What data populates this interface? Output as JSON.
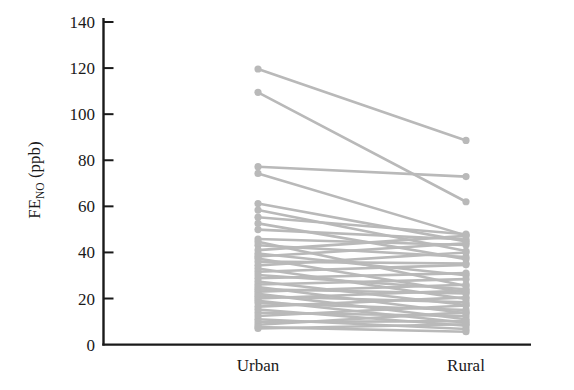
{
  "chart_data": {
    "type": "line",
    "subtype": "paired-slope-chart",
    "title": "",
    "subtitle": "",
    "xlabel": "",
    "ylabel": "FE_NO (ppb)",
    "ylabel_parts": {
      "base": "FE",
      "subscript": "NO",
      "unit": "(ppb)"
    },
    "categories": [
      "Urban",
      "Rural"
    ],
    "x_tick_labels": [
      "Urban",
      "Rural"
    ],
    "y_tick_labels": [
      "0",
      "20",
      "40",
      "60",
      "80",
      "100",
      "120",
      "140"
    ],
    "y_ticks": [
      0,
      20,
      40,
      60,
      80,
      100,
      120,
      140
    ],
    "ylim": [
      0,
      142
    ],
    "grid": false,
    "legend": null,
    "legend_position": "none",
    "marker": "circle",
    "series_color": "#b9b9b9",
    "axis_color": "#1a1a1a",
    "background_color": "#ffffff",
    "n_subjects": 41,
    "series": [
      {
        "name": "subject-01",
        "values": [
          119.6,
          88.6
        ]
      },
      {
        "name": "subject-02",
        "values": [
          109.5,
          62.0
        ]
      },
      {
        "name": "subject-03",
        "values": [
          77.2,
          72.9
        ]
      },
      {
        "name": "subject-04",
        "values": [
          74.3,
          47.4
        ]
      },
      {
        "name": "subject-05",
        "values": [
          61.2,
          44.8
        ]
      },
      {
        "name": "subject-06",
        "values": [
          58.4,
          40.6
        ]
      },
      {
        "name": "subject-07",
        "values": [
          55.3,
          47.9
        ]
      },
      {
        "name": "subject-08",
        "values": [
          52.6,
          37.1
        ]
      },
      {
        "name": "subject-09",
        "values": [
          49.9,
          45.6
        ]
      },
      {
        "name": "subject-10",
        "values": [
          45.8,
          43.2
        ]
      },
      {
        "name": "subject-11",
        "values": [
          44.6,
          25.4
        ]
      },
      {
        "name": "subject-12",
        "values": [
          43.1,
          38.0
        ]
      },
      {
        "name": "subject-13",
        "values": [
          41.0,
          47.2
        ]
      },
      {
        "name": "subject-14",
        "values": [
          39.5,
          30.1
        ]
      },
      {
        "name": "subject-15",
        "values": [
          38.2,
          44.0
        ]
      },
      {
        "name": "subject-16",
        "values": [
          37.4,
          22.6
        ]
      },
      {
        "name": "subject-17",
        "values": [
          36.0,
          35.2
        ]
      },
      {
        "name": "subject-18",
        "values": [
          34.4,
          40.0
        ]
      },
      {
        "name": "subject-19",
        "values": [
          33.0,
          19.8
        ]
      },
      {
        "name": "subject-20",
        "values": [
          31.6,
          34.6
        ]
      },
      {
        "name": "subject-21",
        "values": [
          30.2,
          24.0
        ]
      },
      {
        "name": "subject-22",
        "values": [
          28.8,
          31.0
        ]
      },
      {
        "name": "subject-23",
        "values": [
          27.4,
          17.2
        ]
      },
      {
        "name": "subject-24",
        "values": [
          26.1,
          28.4
        ]
      },
      {
        "name": "subject-25",
        "values": [
          25.0,
          13.6
        ]
      },
      {
        "name": "subject-26",
        "values": [
          24.0,
          22.2
        ]
      },
      {
        "name": "subject-27",
        "values": [
          23.0,
          26.0
        ]
      },
      {
        "name": "subject-28",
        "values": [
          22.0,
          11.0
        ]
      },
      {
        "name": "subject-29",
        "values": [
          21.0,
          18.4
        ]
      },
      {
        "name": "subject-30",
        "values": [
          20.0,
          23.5
        ]
      },
      {
        "name": "subject-31",
        "values": [
          19.0,
          9.5
        ]
      },
      {
        "name": "subject-32",
        "values": [
          18.0,
          15.0
        ]
      },
      {
        "name": "subject-33",
        "values": [
          16.5,
          20.5
        ]
      },
      {
        "name": "subject-34",
        "values": [
          15.2,
          8.2
        ]
      },
      {
        "name": "subject-35",
        "values": [
          13.8,
          12.4
        ]
      },
      {
        "name": "subject-36",
        "values": [
          12.4,
          17.0
        ]
      },
      {
        "name": "subject-37",
        "values": [
          11.0,
          6.8
        ]
      },
      {
        "name": "subject-38",
        "values": [
          9.8,
          10.2
        ]
      },
      {
        "name": "subject-39",
        "values": [
          8.6,
          14.0
        ]
      },
      {
        "name": "subject-40",
        "values": [
          7.6,
          5.6
        ]
      },
      {
        "name": "subject-41",
        "values": [
          7.0,
          8.8
        ]
      }
    ]
  }
}
